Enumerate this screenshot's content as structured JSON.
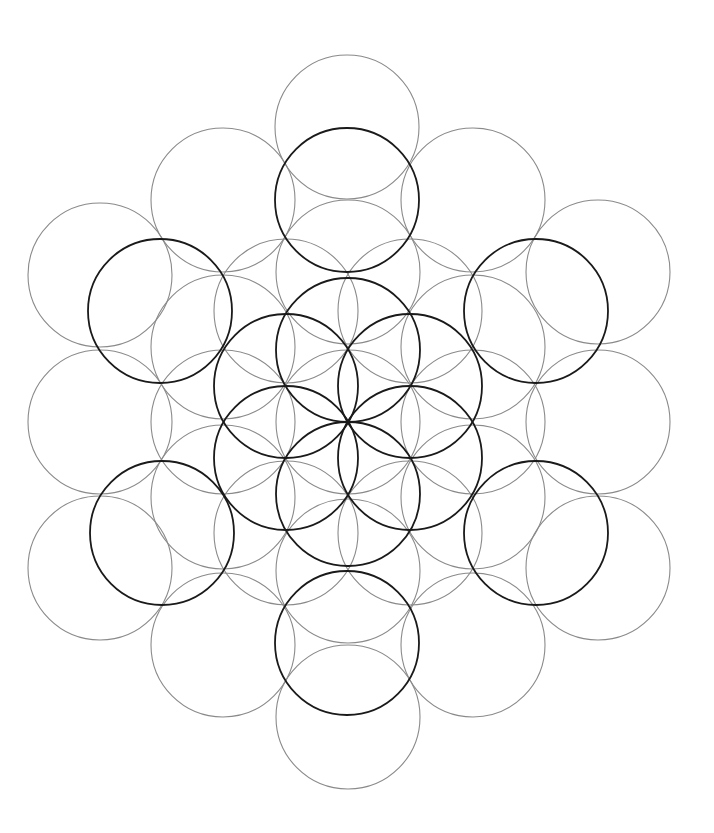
{
  "diagram": {
    "title": "",
    "width": 714,
    "height": 833,
    "radius": 72,
    "colors": {
      "background": "#ffffff",
      "dark": "#1a1a1a",
      "light": "#8a8a8a"
    },
    "dark_circles": [
      [
        348,
        350
      ],
      [
        410,
        386
      ],
      [
        410,
        458
      ],
      [
        348,
        494
      ],
      [
        286,
        458
      ],
      [
        286,
        386
      ],
      [
        160,
        311
      ],
      [
        347,
        200
      ],
      [
        536,
        311
      ],
      [
        536,
        533
      ],
      [
        347,
        643
      ],
      [
        162,
        533
      ]
    ],
    "light_circles": [
      [
        348,
        422
      ],
      [
        347,
        127
      ],
      [
        348,
        272
      ],
      [
        348,
        571
      ],
      [
        348,
        717
      ],
      [
        223,
        200
      ],
      [
        473,
        200
      ],
      [
        223,
        645
      ],
      [
        473,
        645
      ],
      [
        100,
        275
      ],
      [
        598,
        272
      ],
      [
        100,
        422
      ],
      [
        598,
        422
      ],
      [
        100,
        568
      ],
      [
        598,
        568
      ],
      [
        223,
        347
      ],
      [
        473,
        347
      ],
      [
        223,
        497
      ],
      [
        473,
        497
      ],
      [
        286,
        311
      ],
      [
        410,
        311
      ],
      [
        286,
        533
      ],
      [
        410,
        533
      ],
      [
        223,
        422
      ],
      [
        473,
        422
      ]
    ]
  }
}
